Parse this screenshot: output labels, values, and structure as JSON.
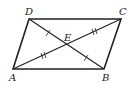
{
  "diagram": {
    "type": "parallelogram with diagonals",
    "vertices": {
      "A": {
        "label": "A",
        "x": 13,
        "y": 69
      },
      "B": {
        "label": "B",
        "x": 104,
        "y": 69
      },
      "C": {
        "label": "C",
        "x": 121,
        "y": 19
      },
      "D": {
        "label": "D",
        "x": 29,
        "y": 19
      }
    },
    "intersection": {
      "label": "E",
      "x": 67,
      "y": 44
    },
    "edges": [
      "AB",
      "BC",
      "CD",
      "DA"
    ],
    "diagonals": [
      "AC",
      "BD"
    ],
    "tick_marks": {
      "single": [
        "DE",
        "EB"
      ],
      "double": [
        "AE",
        "EC"
      ]
    }
  }
}
